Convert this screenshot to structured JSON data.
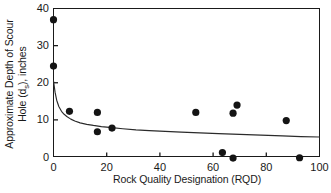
{
  "chart_data": {
    "type": "scatter",
    "title": "",
    "xlabel": "Rock Quality Designation (RQD)",
    "ylabel_line1": "Approximate Depth of Scour",
    "ylabel_line2_pre": "Hole (d",
    "ylabel_line2_sub": "s",
    "ylabel_line2_post": "), inches",
    "xlim": [
      0,
      100
    ],
    "ylim": [
      0,
      40
    ],
    "xticks": [
      0,
      20,
      40,
      60,
      80,
      100
    ],
    "yticks": [
      0,
      10,
      20,
      30,
      40
    ],
    "xtick_labels": [
      "0",
      "20",
      "40",
      "60",
      "80",
      "100"
    ],
    "ytick_labels": [
      "0",
      "10",
      "20",
      "30",
      "40"
    ],
    "grid": false,
    "legend": "none",
    "marker_color": "#141414",
    "axis_color": "#1a1a1a",
    "curve_color": "#2b2b2b",
    "points": [
      {
        "x": 0.0,
        "y": 37.0
      },
      {
        "x": 0.0,
        "y": 24.5
      },
      {
        "x": 6.0,
        "y": 12.3
      },
      {
        "x": 16.5,
        "y": 12.0
      },
      {
        "x": 16.5,
        "y": 6.8
      },
      {
        "x": 22.0,
        "y": 7.8
      },
      {
        "x": 53.5,
        "y": 12.0
      },
      {
        "x": 63.5,
        "y": 1.2
      },
      {
        "x": 67.5,
        "y": -0.3
      },
      {
        "x": 67.5,
        "y": 11.8
      },
      {
        "x": 69.0,
        "y": 14.0
      },
      {
        "x": 87.5,
        "y": 9.8
      },
      {
        "x": 92.5,
        "y": -0.2
      }
    ],
    "fit_curve": {
      "name": "best-fit decay curve",
      "x": [
        0.0,
        0.6,
        1.2,
        2.0,
        3.0,
        4.0,
        5.0,
        6.5,
        8.0,
        10.0,
        12.5,
        15.0,
        18.0,
        22.0,
        26.0,
        31.0,
        36.0,
        42.0,
        48.0,
        55.0,
        62.0,
        70.0,
        78.0,
        86.0,
        93.0,
        100.0
      ],
      "y": [
        20.5,
        17.4,
        15.3,
        13.6,
        12.3,
        11.5,
        10.9,
        10.2,
        9.7,
        9.2,
        8.8,
        8.5,
        8.2,
        7.9,
        7.6,
        7.3,
        7.1,
        6.9,
        6.7,
        6.5,
        6.3,
        6.1,
        5.9,
        5.7,
        5.5,
        5.4
      ]
    }
  }
}
